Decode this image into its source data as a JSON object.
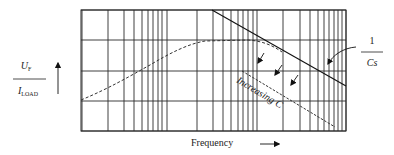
{
  "diagram": {
    "type": "log-log frequency response plot",
    "grid": {
      "left": 81,
      "right": 346,
      "top": 10,
      "bottom": 131,
      "horizontal_lines_y": [
        10,
        40,
        71,
        101,
        131
      ],
      "vertical_lines_x": [
        82,
        108,
        124,
        134,
        142,
        148,
        153,
        158,
        162,
        167,
        197,
        213,
        223,
        231,
        238,
        243,
        248,
        253,
        257,
        283,
        300,
        310,
        318,
        324,
        329,
        334,
        338,
        342,
        346
      ]
    },
    "y_axis": {
      "label_numerator": "U",
      "label_numerator_sub": "F",
      "label_denominator": "I",
      "label_denominator_sub": "LOAD",
      "arrow": "up-arrow"
    },
    "x_axis": {
      "label": "Frequency",
      "arrow": "right-arrow"
    },
    "curves": [
      {
        "name": "impedance-curve",
        "style": "dashed",
        "description": "rises, plateaus, then follows 1/Cs asymptote"
      },
      {
        "name": "capacitive-asymptote",
        "style": "solid",
        "label_numerator": "1",
        "label_denominator": "Cs"
      },
      {
        "name": "increased-capacitance-asymptote",
        "style": "dashed"
      }
    ],
    "annotations": {
      "increasing_c": "Increasing C",
      "shift_arrows_count": 3
    }
  }
}
